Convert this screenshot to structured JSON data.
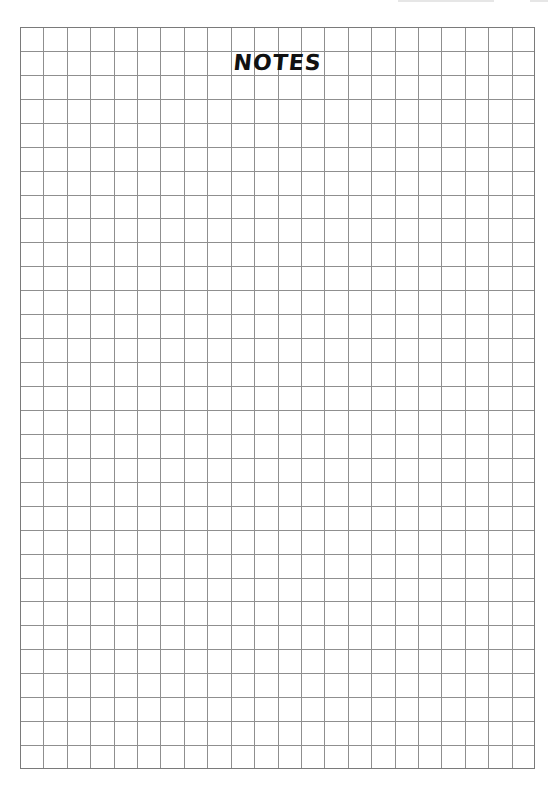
{
  "page": {
    "title": "NOTES",
    "header_text": ""
  },
  "grid": {
    "columns": 22,
    "rows": 31,
    "line_color": "#8f8f8f",
    "border_color": "#7a7a7a"
  }
}
